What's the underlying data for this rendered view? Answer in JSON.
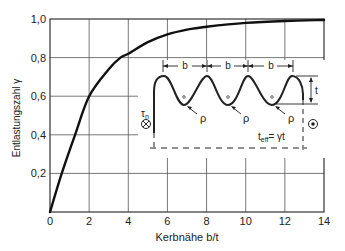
{
  "chart_data": {
    "type": "line",
    "title": "",
    "xlabel": "Kerbnähe b/t",
    "ylabel": "Entlastungszahl γ",
    "xlim": [
      0,
      14
    ],
    "ylim": [
      0,
      1.0
    ],
    "grid": true,
    "x_ticks": [
      0,
      2,
      4,
      6,
      8,
      10,
      12,
      14
    ],
    "x_tick_labels": [
      "0",
      "2",
      "4",
      "6",
      "8",
      "10",
      "12",
      "14"
    ],
    "y_ticks": [
      0.2,
      0.4,
      0.6,
      0.8,
      1.0
    ],
    "y_tick_labels": [
      "0,2",
      "0,4",
      "0,6",
      "0,8",
      "1,0"
    ],
    "series": [
      {
        "name": "γ(b/t)",
        "x": [
          0,
          0.6,
          1.28,
          2,
          3,
          3.6,
          4,
          5,
          6,
          7,
          8,
          10,
          12,
          14
        ],
        "values": [
          0,
          0.2,
          0.4,
          0.6,
          0.74,
          0.8,
          0.82,
          0.88,
          0.92,
          0.945,
          0.96,
          0.98,
          0.99,
          0.995
        ]
      }
    ],
    "inset": {
      "description": "Notched cross-section with equally spaced notches",
      "labels": {
        "spacing": "b",
        "depth": "t",
        "radius": "ρ",
        "shear_stress": "τ",
        "shear_stress_sub": "n",
        "effective_depth": "t",
        "effective_depth_sub": "eff",
        "effective_depth_rhs": "= γt",
        "into_page_symbol": "⊗",
        "out_of_page_symbol": "⊙"
      }
    }
  }
}
